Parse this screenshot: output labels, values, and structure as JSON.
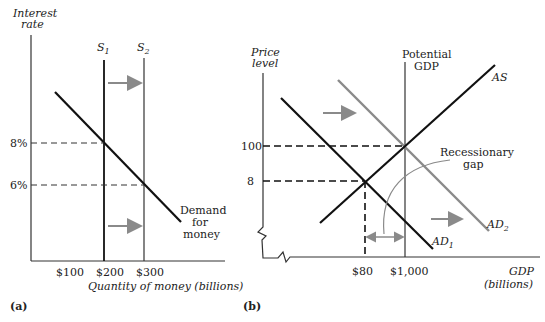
{
  "panel_a": {
    "label": "(a)",
    "y_axis_label_line1": "Interest",
    "y_axis_label_line2": "rate",
    "x_axis_label": "Quantity of money (billions)",
    "supply_1": {
      "base": "S",
      "sub": "1"
    },
    "supply_2": {
      "base": "S",
      "sub": "2"
    },
    "demand_label_line1": "Demand",
    "demand_label_line2": "for",
    "demand_label_line3": "money",
    "y_ticks": [
      "8%",
      "6%"
    ],
    "x_ticks": [
      "$100",
      "$200",
      "$300"
    ]
  },
  "panel_b": {
    "label": "(b)",
    "y_axis_label_line1": "Price",
    "y_axis_label_line2": "level",
    "x_axis_label_line1": "GDP",
    "x_axis_label_line2": "(billions)",
    "potential_line1": "Potential",
    "potential_line2": "GDP",
    "as_label": "AS",
    "ad1": {
      "base": "AD",
      "sub": "1"
    },
    "ad2": {
      "base": "AD",
      "sub": "2"
    },
    "gap_line1": "Recessionary",
    "gap_line2": "gap",
    "y_ticks": [
      "100",
      "8"
    ],
    "x_ticks": [
      "$80",
      "$1,000"
    ]
  },
  "colors": {
    "line": "#111111",
    "shifted": "#8a8a8a",
    "axis": "#333333"
  }
}
